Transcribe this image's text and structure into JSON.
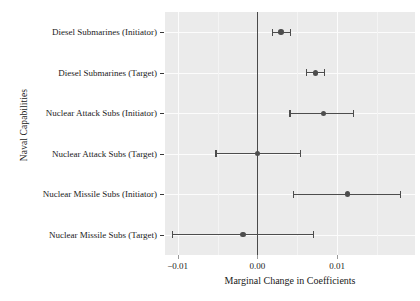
{
  "chart_data": {
    "type": "scatter",
    "title": "",
    "subtitle": "",
    "xlabel": "Marginal Change in Coefficients",
    "ylabel": "Naval Capabilities",
    "xlim": [
      -0.0116,
      0.0198
    ],
    "xticks": [
      -0.01,
      0.0,
      0.01
    ],
    "xticklabels": [
      "−0.01",
      "0.00",
      "0.01"
    ],
    "grid": true,
    "legend": null,
    "zero_reference_line": 0.0,
    "orientation": "horizontal",
    "categories": [
      "Diesel Submarines (Initiator)",
      "Diesel Submarines (Target)",
      "Nuclear Attack Subs (Initiator)",
      "Nuclear Attack Subs (Target)",
      "Nuclear Missile Subs (Initiator)",
      "Nuclear Missile Subs (Target)"
    ],
    "points": [
      {
        "label": "Diesel Submarines (Initiator)",
        "estimate": 0.003,
        "ci_low": 0.0019,
        "ci_high": 0.0042
      },
      {
        "label": "Diesel Submarines (Target)",
        "estimate": 0.0073,
        "ci_low": 0.0062,
        "ci_high": 0.0084
      },
      {
        "label": "Nuclear Attack Subs (Initiator)",
        "estimate": 0.0083,
        "ci_low": 0.0041,
        "ci_high": 0.0121
      },
      {
        "label": "Nuclear Attack Subs (Target)",
        "estimate": 0.0,
        "ci_low": -0.0052,
        "ci_high": 0.0054
      },
      {
        "label": "Nuclear Missile Subs (Initiator)",
        "estimate": 0.0113,
        "ci_low": 0.0045,
        "ci_high": 0.018
      },
      {
        "label": "Nuclear Missile Subs (Target)",
        "estimate": -0.0018,
        "ci_low": -0.0107,
        "ci_high": 0.007
      }
    ],
    "marker_color": "#4d4d4d",
    "panel_background": "#ebebeb",
    "grid_color": "#fcfcfc"
  },
  "axes": {
    "y_title": "Naval Capabilities",
    "x_title": "Marginal Change in Coefficients",
    "y_tick_labels": [
      "Diesel Submarines (Initiator)",
      "Diesel Submarines (Target)",
      "Nuclear Attack Subs (Initiator)",
      "Nuclear Attack Subs (Target)",
      "Nuclear Missile Subs (Initiator)",
      "Nuclear Missile Subs (Target)"
    ],
    "x_tick_labels": [
      "−0.01",
      "0.00",
      "0.01"
    ]
  }
}
